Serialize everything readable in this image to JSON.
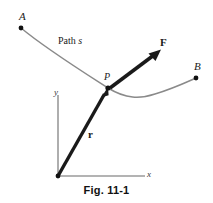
{
  "figure": {
    "caption": "Fig. 11-1",
    "background_color": "#ffffff",
    "labels": {
      "point_a": "A",
      "point_b": "B",
      "point_p": "P",
      "path_prefix": "Path",
      "path_symbol": "s",
      "force_vector": "F",
      "position_vector": "r",
      "axis_x": "x",
      "axis_y": "y"
    },
    "colors": {
      "curve": "#8a8a8a",
      "axis": "#9a9a9a",
      "vector": "#1a1a1a",
      "point_dot": "#111111",
      "text": "#1a1a1a"
    },
    "geometry": {
      "origin": "58,176",
      "point_p": "108,88",
      "point_a": "21,28",
      "point_b": "196,78",
      "force_tip": "160,50",
      "x_axis_end": "145,176",
      "y_axis_top": "58,95"
    }
  }
}
